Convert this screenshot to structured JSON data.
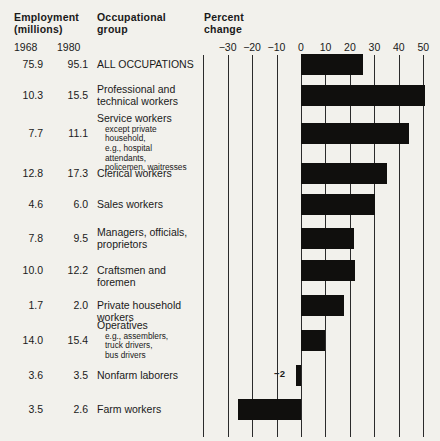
{
  "header": {
    "employment_line1": "Employment",
    "employment_line2": "(millions)",
    "occupational_line1": "Occupational",
    "occupational_line2": "group",
    "percent_line1": "Percent",
    "percent_line2": "change",
    "year_1968": "1968",
    "year_1980": "1980"
  },
  "axis": {
    "ticks": [
      "−30",
      "−20",
      "−10",
      "0",
      "10",
      "20",
      "30",
      "40",
      "50"
    ],
    "tick_values": [
      -30,
      -20,
      -10,
      0,
      10,
      20,
      30,
      40,
      50
    ]
  },
  "annotations": {
    "nonfarm_note": "−2"
  },
  "rows": [
    {
      "v1968": "75.9",
      "v1980": "95.1",
      "group": "ALL OCCUPATIONS",
      "sub": []
    },
    {
      "v1968": "10.3",
      "v1980": "15.5",
      "group": "Professional and technical workers",
      "sub": []
    },
    {
      "v1968": "7.7",
      "v1980": "11.1",
      "group": "Service workers",
      "sub": [
        "except private household,",
        "e.g., hospital attendants,",
        "policemen, waitresses"
      ]
    },
    {
      "v1968": "12.8",
      "v1980": "17.3",
      "group": "Clerical workers",
      "sub": []
    },
    {
      "v1968": "4.6",
      "v1980": "6.0",
      "group": "Sales workers",
      "sub": []
    },
    {
      "v1968": "7.8",
      "v1980": "9.5",
      "group": "Managers, officials, proprietors",
      "sub": []
    },
    {
      "v1968": "10.0",
      "v1980": "12.2",
      "group": "Craftsmen and foremen",
      "sub": []
    },
    {
      "v1968": "1.7",
      "v1980": "2.0",
      "group": "Private household workers",
      "sub": []
    },
    {
      "v1968": "14.0",
      "v1980": "15.4",
      "group": "Operatives",
      "sub": [
        "e.g., assemblers,",
        "truck drivers,",
        "bus drivers"
      ]
    },
    {
      "v1968": "3.6",
      "v1980": "3.5",
      "group": "Nonfarm laborers",
      "sub": []
    },
    {
      "v1968": "3.5",
      "v1980": "2.6",
      "group": "Farm workers",
      "sub": []
    }
  ],
  "chart_data": {
    "type": "bar",
    "orientation": "horizontal",
    "title": "Percent change",
    "xlabel": "Percent change",
    "ylabel": "Occupational group",
    "xlim": [
      -40,
      53
    ],
    "grid": true,
    "legend": "none",
    "categories": [
      "ALL OCCUPATIONS",
      "Professional and technical workers",
      "Service workers",
      "Clerical workers",
      "Sales workers",
      "Managers, officials, proprietors",
      "Craftsmen and foremen",
      "Private household workers",
      "Operatives",
      "Nonfarm laborers",
      "Farm workers"
    ],
    "values": [
      25.3,
      50.5,
      44.2,
      35.2,
      30.4,
      21.8,
      22.0,
      17.6,
      10.0,
      -2.0,
      -25.7
    ],
    "series": [
      {
        "name": "Employment 1968 (millions)",
        "values": [
          75.9,
          10.3,
          7.7,
          12.8,
          4.6,
          7.8,
          10.0,
          1.7,
          14.0,
          3.6,
          3.5
        ]
      },
      {
        "name": "Employment 1980 (millions)",
        "values": [
          95.1,
          15.5,
          11.1,
          17.3,
          6.0,
          9.5,
          12.2,
          2.0,
          15.4,
          3.5,
          2.6
        ]
      },
      {
        "name": "Percent change",
        "values": [
          25.3,
          50.5,
          44.2,
          35.2,
          30.4,
          21.8,
          22.0,
          17.6,
          10.0,
          -2.0,
          -25.7
        ]
      }
    ],
    "data_labels": {
      "Nonfarm laborers": "−2"
    },
    "bar_color": "#100f0d",
    "background": "#f2f1ec"
  }
}
